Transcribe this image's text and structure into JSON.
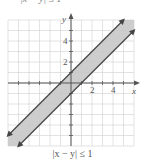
{
  "top_text": "|x − y| ≤ 1",
  "chart_data": {
    "type": "area",
    "title": "",
    "caption": "|x − y| ≤ 1",
    "xlabel": "x",
    "ylabel": "y",
    "xlim": [
      -6,
      6
    ],
    "ylim": [
      -6,
      6
    ],
    "grid": true,
    "x_tick_labels": [
      "2",
      "4"
    ],
    "x_tick_values": [
      2,
      4
    ],
    "y_tick_labels": [
      "2",
      "4"
    ],
    "y_tick_values": [
      2,
      4
    ],
    "series": [
      {
        "name": "y = x + 1",
        "style": "solid boundary line with arrows",
        "points": [
          [
            -6,
            -5
          ],
          [
            5,
            6
          ]
        ]
      },
      {
        "name": "y = x − 1",
        "style": "solid boundary line with arrows",
        "points": [
          [
            -5,
            -6
          ],
          [
            6,
            5
          ]
        ]
      }
    ],
    "shaded_region": "band between y = x − 1 and y = x + 1",
    "colors": {
      "shade": "#c8c8c8",
      "grid": "#d0d0d0",
      "axis": "#555555",
      "line": "#444444"
    }
  }
}
